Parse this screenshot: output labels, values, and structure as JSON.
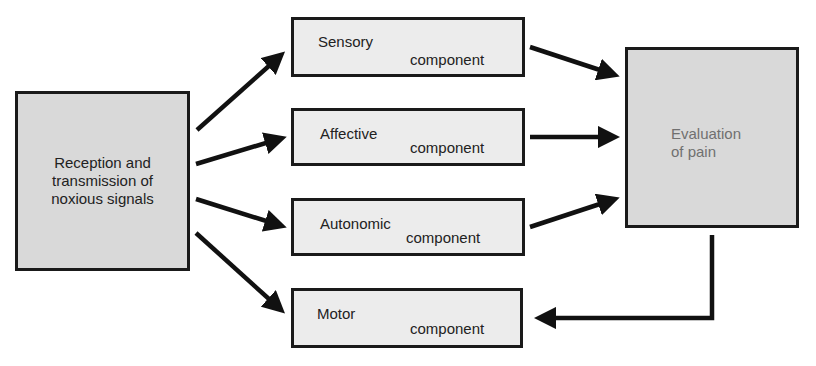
{
  "diagram": {
    "source_node": {
      "label": "Reception and\ntransmission of\nnoxious signals"
    },
    "components": [
      {
        "id": "sensory",
        "name": "Sensory",
        "suffix": "component"
      },
      {
        "id": "affective",
        "name": "Affective",
        "suffix": "component"
      },
      {
        "id": "autonomic",
        "name": "Autonomic",
        "suffix": "component"
      },
      {
        "id": "motor",
        "name": "Motor",
        "suffix": "component"
      }
    ],
    "target_node": {
      "label": "Evaluation\nof pain"
    },
    "edges": [
      {
        "from": "source",
        "to": "sensory"
      },
      {
        "from": "source",
        "to": "affective"
      },
      {
        "from": "source",
        "to": "autonomic"
      },
      {
        "from": "source",
        "to": "motor"
      },
      {
        "from": "sensory",
        "to": "evaluation"
      },
      {
        "from": "affective",
        "to": "evaluation"
      },
      {
        "from": "autonomic",
        "to": "evaluation"
      },
      {
        "from": "evaluation",
        "to": "motor"
      }
    ],
    "colors": {
      "box_fill_dark": "#d9d9d9",
      "box_fill_light": "#ececec",
      "border": "#1a1a1a",
      "arrow": "#111111",
      "evaluation_text": "#707070"
    }
  }
}
